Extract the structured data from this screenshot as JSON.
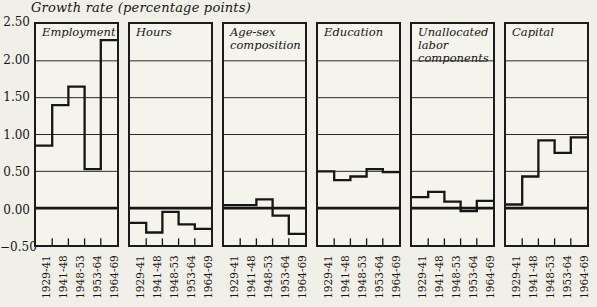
{
  "title": "Growth rate (percentage points)",
  "y_axis": {
    "labels": [
      "2.50",
      "2.00",
      "1.50",
      "1.00",
      "0.50",
      "0.00",
      "−0.50"
    ],
    "max": 2.5,
    "min": -0.5,
    "step": 0.5
  },
  "chart_data": {
    "type": "step",
    "title": "Growth rate (percentage points)",
    "categories": [
      "1929-41",
      "1941-48",
      "1948-53",
      "1953-64",
      "1964-69"
    ],
    "series": [
      {
        "name": "Employment",
        "values": [
          0.85,
          1.4,
          1.65,
          0.53,
          2.28
        ]
      },
      {
        "name": "Hours",
        "values": [
          -0.2,
          -0.33,
          -0.05,
          -0.22,
          -0.28
        ]
      },
      {
        "name": "Age-sex composition",
        "values": [
          0.04,
          0.04,
          0.12,
          -0.1,
          -0.35
        ]
      },
      {
        "name": "Education",
        "values": [
          0.5,
          0.38,
          0.43,
          0.53,
          0.49
        ]
      },
      {
        "name": "Unallocated labor components",
        "values": [
          0.15,
          0.22,
          0.09,
          -0.04,
          0.1
        ]
      },
      {
        "name": "Capital",
        "values": [
          0.05,
          0.43,
          0.92,
          0.75,
          0.96
        ]
      }
    ],
    "ylim": [
      -0.5,
      2.5
    ],
    "grid": true,
    "zero_line_emphasized": true,
    "panel_title_position": "top-left-inside",
    "x_tick_label_rotation": -90
  },
  "colors": {
    "line": "#161616",
    "background": "#f0efe8",
    "panel_background": "#f4f3ec"
  }
}
